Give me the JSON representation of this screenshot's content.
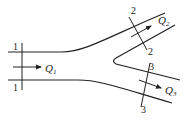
{
  "diagram": {
    "title": "",
    "sections": [
      {
        "id": "1",
        "label_top": "1",
        "label_bottom": "1"
      },
      {
        "id": "2",
        "label_top": "2",
        "label_bottom": "2"
      },
      {
        "id": "3",
        "label_top": "3",
        "label_bottom": "3"
      }
    ],
    "flows": [
      {
        "symbol": "Q",
        "subscript": "1"
      },
      {
        "symbol": "Q",
        "subscript": "2"
      },
      {
        "symbol": "Q",
        "subscript": "3"
      }
    ],
    "colors": {
      "line": "#222222",
      "background": "#ffffff"
    }
  }
}
